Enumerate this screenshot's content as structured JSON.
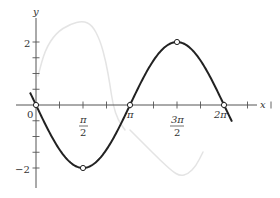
{
  "chart_data": {
    "type": "line",
    "title": "",
    "xlabel": "x",
    "ylabel": "y",
    "xlim": [
      -0.65,
      7.3
    ],
    "ylim": [
      -2.65,
      2.85
    ],
    "grid": false,
    "legend": null,
    "x_tick_step": 0.7853981634,
    "x_tick_labels": [
      {
        "value": 0,
        "label": "0"
      },
      {
        "value": 1.5707963268,
        "label": "π/2",
        "num": "π",
        "den": "2"
      },
      {
        "value": 3.1415926536,
        "label": "π"
      },
      {
        "value": 4.7123889804,
        "label": "3π/2",
        "num": "3π",
        "den": "2"
      },
      {
        "value": 6.2831853072,
        "label": "2π"
      }
    ],
    "y_tick_step": 0.5,
    "y_tick_labels": [
      {
        "value": 2,
        "label": "2"
      },
      {
        "value": -2,
        "label": "−2"
      }
    ],
    "series": [
      {
        "name": "y = -2 sin x",
        "function": "-2*sin(x)",
        "x_range": [
          -0.2,
          6.55
        ],
        "color": "#222222",
        "line_width": 2,
        "marked_points": [
          {
            "x": 0,
            "y": 0
          },
          {
            "x": 1.5707963268,
            "y": -2
          },
          {
            "x": 3.1415926536,
            "y": 0
          },
          {
            "x": 4.7123889804,
            "y": 2
          },
          {
            "x": 6.2831853072,
            "y": 0
          }
        ]
      },
      {
        "name": "faint background curve",
        "color": "#e4e4e4",
        "line_width": 1.5,
        "points_px": [
          [
            38,
            76
          ],
          [
            45,
            50
          ],
          [
            56,
            33
          ],
          [
            70,
            24
          ],
          [
            83,
            21
          ],
          [
            92,
            25
          ],
          [
            100,
            40
          ],
          [
            106,
            62
          ],
          [
            110,
            85
          ],
          [
            113,
            105
          ],
          [
            118,
            120
          ],
          [
            125,
            130
          ]
        ],
        "points_px_2": [
          [
            130,
            130
          ],
          [
            145,
            145
          ],
          [
            160,
            160
          ],
          [
            172,
            171
          ],
          [
            180,
            176
          ],
          [
            188,
            174
          ],
          [
            196,
            166
          ],
          [
            203,
            152
          ]
        ]
      }
    ]
  },
  "axes": {
    "x_label": "x",
    "y_label": "y",
    "origin_label": "0",
    "pi_half_num": "π",
    "pi_half_den": "2",
    "pi_label": "π",
    "three_pi_half_num": "3π",
    "three_pi_half_den": "2",
    "two_pi_label": "2π",
    "y_pos_label": "2",
    "y_neg_label": "−2"
  }
}
